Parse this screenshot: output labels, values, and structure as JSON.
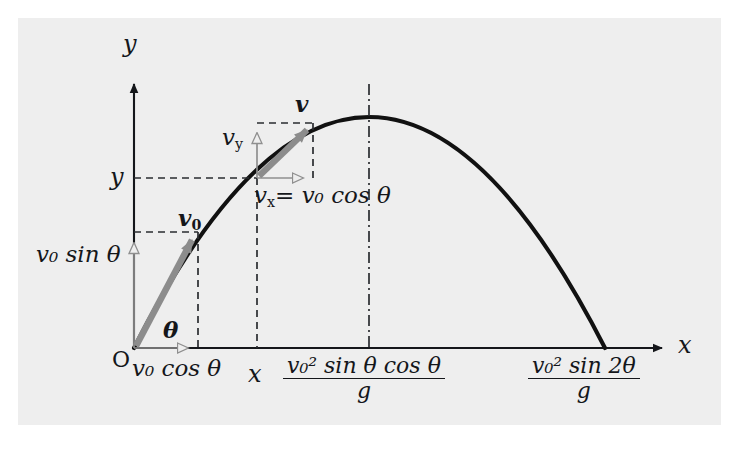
{
  "figure": {
    "type": "projectile-motion-diagram",
    "background_color": "#eeeeee",
    "page_color": "#ffffff",
    "curve_color": "#111111",
    "vector_color": "#8c8c8c",
    "axis_color": "#14161a"
  },
  "axes": {
    "y_label": "y",
    "x_label": "x",
    "origin_label": "O"
  },
  "labels": {
    "v0_vector": "v",
    "v0_vector_sub": "0",
    "v_vector": "v",
    "vy_component": "v",
    "vy_component_sub": "y",
    "vx_component_equation_lhs": "v",
    "vx_component_equation_lhs_sub": "x",
    "vx_component_equation_rhs": "= v₀ cos θ",
    "v0_sin_theta": "v₀ sin θ",
    "v0_cos_theta": "v₀ cos θ",
    "theta_origin": "θ",
    "theta_angle": "θ",
    "y_tick": "y",
    "x_tick": "x"
  },
  "formulas": {
    "apex_x": {
      "numerator": "v₀² sin θ cos θ",
      "denominator": "g"
    },
    "range_x": {
      "numerator": "v₀² sin 2θ",
      "denominator": "g"
    }
  },
  "chart_data": {
    "type": "line",
    "title": "",
    "xlabel": "x",
    "ylabel": "y",
    "origin": [
      134,
      348
    ],
    "apex": [
      369,
      117
    ],
    "landing": [
      605,
      348
    ],
    "sample_point": [
      257,
      178
    ],
    "v0_tip": [
      198,
      232
    ],
    "v_tip": [
      313,
      123
    ],
    "axis_x_end": [
      668,
      348
    ],
    "axis_y_top": [
      134,
      80
    ],
    "grid": false,
    "legend": false
  }
}
